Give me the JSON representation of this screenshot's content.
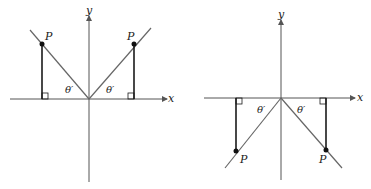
{
  "figure": {
    "colors": {
      "axis": "#555555",
      "ray": "#666666",
      "perpendicular": "#1a1a1a",
      "point": "#111111"
    },
    "left_panel": {
      "x_axis_label": "x",
      "y_axis_label": "y",
      "points": [
        {
          "label": "P",
          "quadrant": "II"
        },
        {
          "label": "P",
          "quadrant": "I"
        }
      ],
      "angle_labels": [
        "θ′",
        "θ′"
      ]
    },
    "right_panel": {
      "x_axis_label": "x",
      "y_axis_label": "y",
      "points": [
        {
          "label": "P",
          "quadrant": "III"
        },
        {
          "label": "P",
          "quadrant": "IV"
        }
      ],
      "angle_labels": [
        "θ′",
        "θ′"
      ]
    }
  }
}
